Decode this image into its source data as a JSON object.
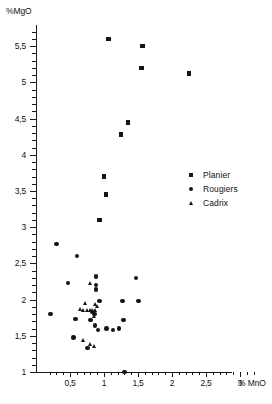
{
  "chart_data": {
    "type": "scatter",
    "title": "",
    "xlabel": "% MnO",
    "ylabel": "%MgO",
    "xlim": [
      0.15,
      3.25
    ],
    "ylim": [
      1.0,
      5.85
    ],
    "grid": false,
    "legend_position": "right-middle",
    "x_ticks": [
      {
        "value": 0.5,
        "label": "0,5"
      },
      {
        "value": 1.0,
        "label": "1"
      },
      {
        "value": 1.5,
        "label": "1,5"
      },
      {
        "value": 2.0,
        "label": "2"
      },
      {
        "value": 2.5,
        "label": "2,5"
      },
      {
        "value": 3.0,
        "label": "3"
      }
    ],
    "x_minor_ticks": [
      0.2,
      0.3,
      0.4,
      0.6,
      0.7,
      0.8,
      0.9,
      1.1,
      1.2,
      1.3,
      1.4,
      1.6,
      1.7,
      1.8,
      1.9,
      2.1,
      2.2,
      2.3,
      2.4,
      2.6,
      2.7,
      2.8,
      2.9,
      3.1,
      3.2
    ],
    "y_ticks": [
      {
        "value": 1.0,
        "label": "1"
      },
      {
        "value": 1.5,
        "label": "1,5"
      },
      {
        "value": 2.0,
        "label": "2"
      },
      {
        "value": 2.5,
        "label": "2,5"
      },
      {
        "value": 3.0,
        "label": "3"
      },
      {
        "value": 3.5,
        "label": "3,5"
      },
      {
        "value": 4.0,
        "label": "4"
      },
      {
        "value": 4.5,
        "label": "4,5"
      },
      {
        "value": 5.0,
        "label": "5"
      },
      {
        "value": 5.5,
        "label": "5,5"
      }
    ],
    "y_minor_ticks": [
      1.1,
      1.2,
      1.3,
      1.4,
      1.6,
      1.7,
      1.8,
      1.9,
      2.1,
      2.2,
      2.3,
      2.4,
      2.6,
      2.7,
      2.8,
      2.9,
      3.1,
      3.2,
      3.3,
      3.4,
      3.6,
      3.7,
      3.8,
      3.9,
      4.1,
      4.2,
      4.3,
      4.4,
      4.6,
      4.7,
      4.8,
      4.9,
      5.1,
      5.2,
      5.3,
      5.4,
      5.6,
      5.7
    ],
    "series": [
      {
        "name": "Planier",
        "marker": "square",
        "color": "#151515",
        "points": [
          [
            1.07,
            5.6
          ],
          [
            1.57,
            5.5
          ],
          [
            1.55,
            5.2
          ],
          [
            2.25,
            5.12
          ],
          [
            1.35,
            4.45
          ],
          [
            1.25,
            4.28
          ],
          [
            1.0,
            3.7
          ],
          [
            1.03,
            3.45
          ],
          [
            0.93,
            3.1
          ]
        ]
      },
      {
        "name": "Rougiers",
        "marker": "circle",
        "color": "#151515",
        "points": [
          [
            0.3,
            2.77
          ],
          [
            0.6,
            2.6
          ],
          [
            0.47,
            2.23
          ],
          [
            0.21,
            1.8
          ],
          [
            0.58,
            1.73
          ],
          [
            0.55,
            1.48
          ],
          [
            0.76,
            1.33
          ],
          [
            0.88,
            2.32
          ],
          [
            0.88,
            2.2
          ],
          [
            0.88,
            2.14
          ],
          [
            0.93,
            1.98
          ],
          [
            0.83,
            1.83
          ],
          [
            0.86,
            1.8
          ],
          [
            0.8,
            1.72
          ],
          [
            0.87,
            1.64
          ],
          [
            0.91,
            1.58
          ],
          [
            1.04,
            1.6
          ],
          [
            1.13,
            1.58
          ],
          [
            1.22,
            1.6
          ],
          [
            1.29,
            1.72
          ],
          [
            1.27,
            1.98
          ],
          [
            1.51,
            1.98
          ],
          [
            1.47,
            2.3
          ],
          [
            1.3,
            1.0
          ]
        ]
      },
      {
        "name": "Cadrix",
        "marker": "triangle",
        "color": "#151515",
        "points": [
          [
            0.8,
            2.22
          ],
          [
            0.73,
            1.95
          ],
          [
            0.88,
            1.94
          ],
          [
            0.7,
            1.85
          ],
          [
            0.76,
            1.85
          ],
          [
            0.8,
            1.85
          ],
          [
            0.84,
            1.85
          ],
          [
            0.88,
            1.85
          ],
          [
            0.66,
            1.86
          ],
          [
            0.91,
            1.9
          ],
          [
            0.86,
            1.77
          ],
          [
            0.7,
            1.44
          ],
          [
            0.8,
            1.38
          ],
          [
            0.86,
            1.36
          ]
        ]
      }
    ]
  },
  "legend": {
    "items": [
      {
        "label": "Planier",
        "marker": "square"
      },
      {
        "label": "Rougiers",
        "marker": "circle"
      },
      {
        "label": "Cadrix",
        "marker": "triangle"
      }
    ]
  }
}
